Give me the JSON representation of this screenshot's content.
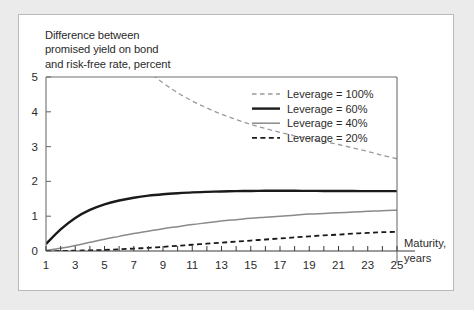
{
  "figure": {
    "background_color": "#ebebeb",
    "panel_color": "#ffffff",
    "border_color": "#b9b9b9"
  },
  "axis_title": "Difference between\npromised yield on bond\nand risk-free rate, percent",
  "x_axis_name_line1": "Maturity,",
  "x_axis_name_line2": "years",
  "y_ticks": [
    "0",
    "1",
    "2",
    "3",
    "4",
    "5"
  ],
  "x_ticks": [
    "1",
    "3",
    "5",
    "7",
    "9",
    "11",
    "13",
    "15",
    "17",
    "19",
    "21",
    "23",
    "25"
  ],
  "legend": {
    "items": [
      {
        "label": "Leverage = 100%",
        "style": "dashed",
        "color": "#9a9a9a",
        "width": 1.3
      },
      {
        "label": "Leverage = 60%",
        "style": "solid",
        "color": "#1a1a1a",
        "width": 2.4
      },
      {
        "label": "Leverage = 40%",
        "style": "solid",
        "color": "#8a8a8a",
        "width": 1.5
      },
      {
        "label": "Leverage = 20%",
        "style": "dashed",
        "color": "#1a1a1a",
        "width": 1.8
      }
    ]
  },
  "chart_data": {
    "type": "line",
    "title": "Difference between promised yield on bond and risk-free rate, percent",
    "xlabel": "Maturity, years",
    "ylabel": "Difference between promised yield on bond and risk-free rate, percent",
    "xlim": [
      1,
      25
    ],
    "ylim": [
      0,
      5
    ],
    "grid": false,
    "legend_position": "upper-right",
    "x": [
      1,
      2,
      3,
      4,
      5,
      6,
      7,
      8,
      9,
      10,
      11,
      12,
      13,
      14,
      15,
      16,
      17,
      18,
      19,
      20,
      21,
      22,
      23,
      24,
      25
    ],
    "series": [
      {
        "name": "Leverage = 100%",
        "values": [
          19.8,
          12.6,
          9.6,
          7.95,
          6.9,
          6.15,
          5.6,
          5.17,
          4.83,
          4.55,
          4.31,
          4.11,
          3.93,
          3.78,
          3.64,
          3.52,
          3.41,
          3.31,
          3.22,
          3.14,
          3.06,
          2.96,
          2.86,
          2.75,
          2.65
        ],
        "note": "Curve exits above the top of the plot for maturities shorter than about 5 years"
      },
      {
        "name": "Leverage = 60%",
        "values": [
          0.2,
          0.62,
          0.95,
          1.18,
          1.34,
          1.45,
          1.53,
          1.59,
          1.63,
          1.66,
          1.685,
          1.7,
          1.71,
          1.72,
          1.725,
          1.73,
          1.73,
          1.73,
          1.728,
          1.726,
          1.724,
          1.722,
          1.72,
          1.72,
          1.72
        ]
      },
      {
        "name": "Leverage = 40%",
        "values": [
          0.02,
          0.08,
          0.16,
          0.25,
          0.34,
          0.42,
          0.5,
          0.57,
          0.64,
          0.7,
          0.76,
          0.81,
          0.86,
          0.9,
          0.94,
          0.97,
          1.0,
          1.03,
          1.06,
          1.08,
          1.1,
          1.12,
          1.14,
          1.16,
          1.17
        ]
      },
      {
        "name": "Leverage = 20%",
        "values": [
          0.0,
          0.0,
          0.01,
          0.02,
          0.03,
          0.05,
          0.07,
          0.09,
          0.12,
          0.15,
          0.18,
          0.21,
          0.24,
          0.27,
          0.3,
          0.33,
          0.36,
          0.39,
          0.42,
          0.45,
          0.47,
          0.5,
          0.52,
          0.54,
          0.55
        ]
      }
    ]
  }
}
